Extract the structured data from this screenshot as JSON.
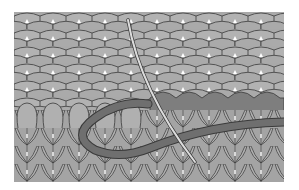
{
  "figure": {
    "colors": {
      "background": "#ffffff",
      "fabric": "#a9a9a9",
      "fabric_light": "#b4b4b4",
      "fabric_dark_row": "#7e7e7e",
      "outline": "#3a3a3a",
      "yarn": "#6f6f6f",
      "needle": "#d8d8d8"
    }
  }
}
